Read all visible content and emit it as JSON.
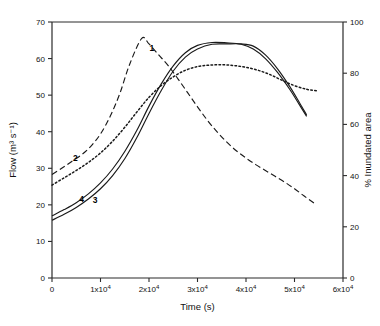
{
  "chart_data": {
    "type": "line",
    "title": "",
    "xlabel": "Time (s)",
    "ylabel": "Flow (m³ s⁻¹)",
    "y2label": "% Inundated area",
    "xlim": [
      0,
      60000
    ],
    "ylim": [
      0,
      70
    ],
    "y2lim": [
      0,
      100
    ],
    "grid": false,
    "legend_position": "inline-curve-labels",
    "xticks": [
      0,
      10000,
      20000,
      30000,
      40000,
      50000,
      60000
    ],
    "xticklabels": [
      "0",
      "1x10",
      "2x10",
      "3x10",
      "4x10",
      "5x10",
      "6x10"
    ],
    "xtick_exponent": "4",
    "yticks": [
      0,
      10,
      20,
      30,
      40,
      50,
      60,
      70
    ],
    "yticklabels": [
      "0",
      "10",
      "20",
      "30",
      "40",
      "50",
      "60",
      "70"
    ],
    "y2ticks": [
      0,
      20,
      40,
      60,
      80,
      100
    ],
    "y2ticklabels": [
      "0",
      "20",
      "40",
      "60",
      "80",
      "100"
    ],
    "series": [
      {
        "name": "1",
        "label": "1",
        "axis": "left",
        "style": "dashed",
        "color": "#1a1a1a",
        "label_x": 20600,
        "label_y": 62.0,
        "x": [
          0,
          2000,
          4000,
          6000,
          8000,
          10000,
          12000,
          14000,
          16000,
          18500,
          20000,
          22000,
          24000,
          26000,
          28000,
          30000,
          32000,
          34000,
          36000,
          38000,
          40000,
          42000,
          44000,
          46000,
          48000,
          50000,
          52000,
          54000
        ],
        "y": [
          28.3,
          30.0,
          31.8,
          33.6,
          36.0,
          39.4,
          44.2,
          50.5,
          58.4,
          65.5,
          64.0,
          61.0,
          58.0,
          54.4,
          50.6,
          46.8,
          43.2,
          40.0,
          37.2,
          34.8,
          32.8,
          31.0,
          29.4,
          27.8,
          26.2,
          24.4,
          22.4,
          20.5
        ]
      },
      {
        "name": "2",
        "label": "2",
        "axis": "left",
        "style": "dotted",
        "color": "#1a1a1a",
        "label_x": 4800,
        "label_y": 32.0,
        "x": [
          0,
          2500,
          5000,
          7500,
          10000,
          12500,
          15000,
          17500,
          20000,
          22500,
          25000,
          27500,
          30000,
          32500,
          35000,
          37500,
          40000,
          42500,
          45000,
          47500,
          50000,
          52500,
          54500
        ],
        "y": [
          25.4,
          27.4,
          29.4,
          31.6,
          34.2,
          37.4,
          41.2,
          45.4,
          49.4,
          52.6,
          55.0,
          56.8,
          57.8,
          58.2,
          58.3,
          58.1,
          57.6,
          56.8,
          55.6,
          54.0,
          52.6,
          51.6,
          51.2
        ]
      },
      {
        "name": "3",
        "label": "3",
        "axis": "left",
        "style": "solid",
        "color": "#1a1a1a",
        "label_x": 8900,
        "label_y": 20.6,
        "x": [
          0,
          2500,
          5000,
          7500,
          10000,
          12500,
          15000,
          17500,
          20000,
          22500,
          25000,
          27500,
          30000,
          33000,
          36000,
          39000,
          41500,
          44000,
          46500,
          49000,
          51000,
          52500
        ],
        "y": [
          15.8,
          17.4,
          19.3,
          21.6,
          24.4,
          28.0,
          32.6,
          38.4,
          45.0,
          51.2,
          56.6,
          60.4,
          62.6,
          63.9,
          64.0,
          64.0,
          63.4,
          61.0,
          57.2,
          52.4,
          48.0,
          44.6
        ]
      },
      {
        "name": "4",
        "label": "4",
        "axis": "left",
        "style": "solid",
        "color": "#1a1a1a",
        "label_x": 6100,
        "label_y": 20.8,
        "x": [
          0,
          2500,
          5000,
          7500,
          10000,
          12500,
          15000,
          17500,
          20000,
          22500,
          25000,
          27500,
          30000,
          33000,
          36000,
          39000,
          41500,
          44000,
          46500,
          49000,
          51000,
          52500
        ],
        "y": [
          17.0,
          18.7,
          20.6,
          23.0,
          26.0,
          29.8,
          34.6,
          40.4,
          47.0,
          53.0,
          58.0,
          61.6,
          63.6,
          64.4,
          64.3,
          63.9,
          62.6,
          60.0,
          56.2,
          51.6,
          47.4,
          44.2
        ]
      }
    ]
  }
}
